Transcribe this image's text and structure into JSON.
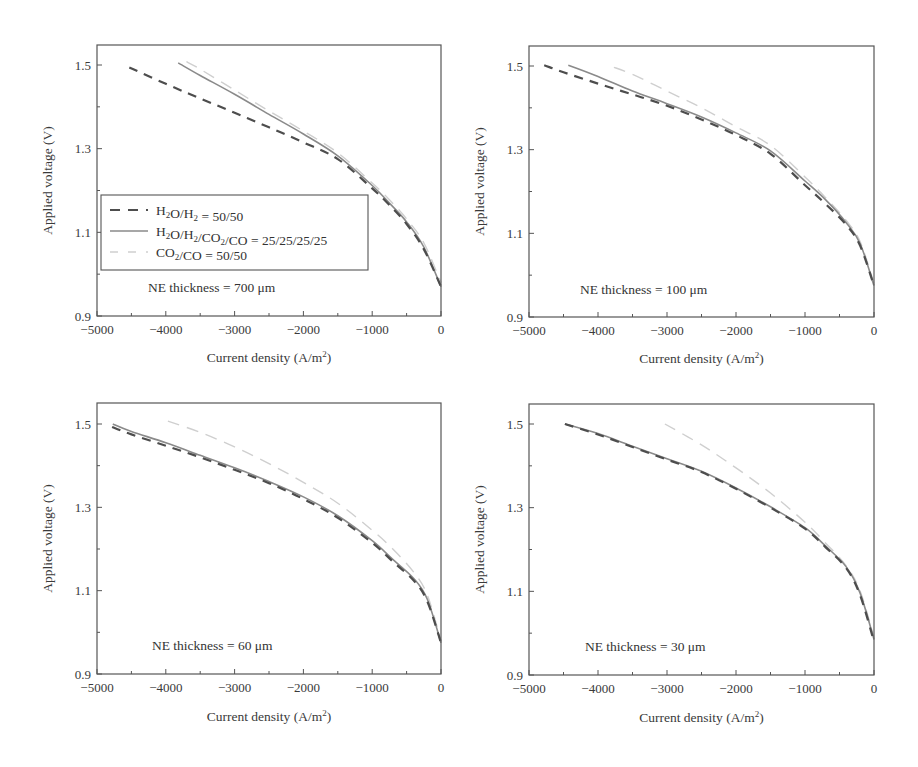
{
  "figure": {
    "legend": {
      "items": [
        {
          "label": "H2O/H2 = 50/50",
          "style": "dashed-dark"
        },
        {
          "label": "H2O/H2/CO2/CO = 25/25/25/25",
          "style": "solid-gray"
        },
        {
          "label": "CO2/CO = 50/50",
          "style": "dashed-light"
        }
      ]
    },
    "series_styles": {
      "H2O/H2 = 50/50": {
        "color": "#4d4d4d",
        "width": 2.2,
        "dash": "9,7"
      },
      "H2O/H2/CO2/CO = 25/25/25/25": {
        "color": "#8a8a8a",
        "width": 1.6,
        "dash": ""
      },
      "CO2/CO = 50/50": {
        "color": "#cfcfcf",
        "width": 1.4,
        "dash": "12,8"
      }
    }
  },
  "chart_data": [
    {
      "type": "line",
      "panel": "top-left",
      "title": "",
      "annotation": "NE thickness = 700 μm",
      "xlabel": "Current density (A/m²)",
      "ylabel": "Applied voltage (V)",
      "xlim": [
        -5000,
        0
      ],
      "ylim": [
        0.9,
        1.55
      ],
      "xticks": [
        -5000,
        -4000,
        -3000,
        -2000,
        -1000,
        0
      ],
      "yticks": [
        0.9,
        1.1,
        1.3,
        1.5
      ],
      "grid": false,
      "legend_position": "center-left (inside)",
      "series": [
        {
          "name": "H2O/H2 = 50/50",
          "x": [
            -4530,
            -4000,
            -3500,
            -3000,
            -2500,
            -2000,
            -1500,
            -1000,
            -750,
            -500,
            -250,
            0
          ],
          "values": [
            1.494,
            1.455,
            1.42,
            1.386,
            1.351,
            1.315,
            1.275,
            1.205,
            1.165,
            1.12,
            1.06,
            0.97
          ]
        },
        {
          "name": "H2O/H2/CO2/CO = 25/25/25/25",
          "x": [
            -3820,
            -3500,
            -3000,
            -2500,
            -2000,
            -1500,
            -1000,
            -750,
            -500,
            -250,
            0
          ],
          "values": [
            1.505,
            1.475,
            1.43,
            1.382,
            1.335,
            1.283,
            1.212,
            1.17,
            1.125,
            1.065,
            0.97
          ]
        },
        {
          "name": "CO2/CO = 50/50",
          "x": [
            -3700,
            -3500,
            -3000,
            -2500,
            -2000,
            -1500,
            -1000,
            -750,
            -500,
            -250,
            0
          ],
          "values": [
            1.508,
            1.49,
            1.44,
            1.39,
            1.342,
            1.29,
            1.218,
            1.178,
            1.132,
            1.075,
            0.98
          ]
        }
      ]
    },
    {
      "type": "line",
      "panel": "top-right",
      "title": "",
      "annotation": "NE thickness = 100 μm",
      "xlabel": "Current density (A/m²)",
      "ylabel": "Applied voltage (V)",
      "xlim": [
        -5000,
        0
      ],
      "ylim": [
        0.9,
        1.55
      ],
      "xticks": [
        -5000,
        -4000,
        -3000,
        -2000,
        -1000,
        0
      ],
      "yticks": [
        0.9,
        1.1,
        1.3,
        1.5
      ],
      "grid": false,
      "series": [
        {
          "name": "H2O/H2 = 50/50",
          "x": [
            -4780,
            -4500,
            -4000,
            -3500,
            -3000,
            -2500,
            -2000,
            -1500,
            -1000,
            -700,
            -400,
            -200,
            0
          ],
          "values": [
            1.502,
            1.485,
            1.458,
            1.432,
            1.405,
            1.372,
            1.335,
            1.29,
            1.215,
            1.17,
            1.12,
            1.07,
            0.975
          ]
        },
        {
          "name": "H2O/H2/CO2/CO = 25/25/25/25",
          "x": [
            -4430,
            -4000,
            -3500,
            -3000,
            -2500,
            -2000,
            -1500,
            -1000,
            -700,
            -400,
            -200,
            0
          ],
          "values": [
            1.502,
            1.475,
            1.44,
            1.41,
            1.378,
            1.34,
            1.297,
            1.225,
            1.18,
            1.125,
            1.075,
            0.975
          ]
        },
        {
          "name": "CO2/CO = 50/50",
          "x": [
            -3770,
            -3500,
            -3000,
            -2500,
            -2000,
            -1500,
            -1000,
            -700,
            -400,
            -200,
            0
          ],
          "values": [
            1.497,
            1.48,
            1.44,
            1.4,
            1.355,
            1.31,
            1.235,
            1.185,
            1.13,
            1.08,
            0.98
          ]
        }
      ]
    },
    {
      "type": "line",
      "panel": "bottom-left",
      "title": "",
      "annotation": "NE thickness = 60 μm",
      "xlabel": "Current density (A/m²)",
      "ylabel": "Applied voltage (V)",
      "xlim": [
        -5000,
        0
      ],
      "ylim": [
        0.9,
        1.55
      ],
      "xticks": [
        -5000,
        -4000,
        -3000,
        -2000,
        -1000,
        0
      ],
      "yticks": [
        0.9,
        1.1,
        1.3,
        1.5
      ],
      "grid": false,
      "series": [
        {
          "name": "H2O/H2 = 50/50",
          "x": [
            -4780,
            -4500,
            -4000,
            -3500,
            -3000,
            -2500,
            -2000,
            -1500,
            -1000,
            -700,
            -400,
            -200,
            0
          ],
          "values": [
            1.493,
            1.475,
            1.448,
            1.42,
            1.39,
            1.358,
            1.32,
            1.275,
            1.215,
            1.17,
            1.125,
            1.075,
            0.975
          ]
        },
        {
          "name": "H2O/H2/CO2/CO = 25/25/25/25",
          "x": [
            -4770,
            -4500,
            -4000,
            -3500,
            -3000,
            -2500,
            -2000,
            -1500,
            -1000,
            -700,
            -400,
            -200,
            0
          ],
          "values": [
            1.5,
            1.482,
            1.455,
            1.425,
            1.395,
            1.362,
            1.325,
            1.28,
            1.22,
            1.175,
            1.13,
            1.08,
            0.975
          ]
        },
        {
          "name": "CO2/CO = 50/50",
          "x": [
            -3970,
            -3500,
            -3000,
            -2500,
            -2000,
            -1500,
            -1000,
            -700,
            -400,
            -200,
            0
          ],
          "values": [
            1.507,
            1.48,
            1.445,
            1.405,
            1.36,
            1.31,
            1.245,
            1.2,
            1.145,
            1.09,
            0.98
          ]
        }
      ]
    },
    {
      "type": "line",
      "panel": "bottom-right",
      "title": "",
      "annotation": "NE thickness = 30 μm",
      "xlabel": "Current density (A/m²)",
      "ylabel": "Applied voltage (V)",
      "xlim": [
        -5000,
        0
      ],
      "ylim": [
        0.9,
        1.55
      ],
      "xticks": [
        -5000,
        -4000,
        -3000,
        -2000,
        -1000,
        0
      ],
      "yticks": [
        0.9,
        1.1,
        1.3,
        1.5
      ],
      "grid": false,
      "series": [
        {
          "name": "H2O/H2 = 50/50",
          "x": [
            -4480,
            -4000,
            -3500,
            -3000,
            -2500,
            -2000,
            -1500,
            -1000,
            -700,
            -400,
            -200,
            0
          ],
          "values": [
            1.5,
            1.475,
            1.445,
            1.415,
            1.385,
            1.345,
            1.3,
            1.25,
            1.205,
            1.155,
            1.09,
            0.98
          ]
        },
        {
          "name": "H2O/H2/CO2/CO = 25/25/25/25",
          "x": [
            -4480,
            -4000,
            -3500,
            -3000,
            -2500,
            -2000,
            -1500,
            -1000,
            -700,
            -400,
            -200,
            0
          ],
          "values": [
            1.5,
            1.477,
            1.447,
            1.417,
            1.387,
            1.347,
            1.302,
            1.252,
            1.208,
            1.158,
            1.095,
            0.985
          ]
        },
        {
          "name": "CO2/CO = 50/50",
          "x": [
            -3030,
            -2500,
            -2000,
            -1500,
            -1000,
            -700,
            -400,
            -200,
            0
          ],
          "values": [
            1.5,
            1.45,
            1.395,
            1.335,
            1.265,
            1.215,
            1.16,
            1.1,
            0.99
          ]
        }
      ]
    }
  ]
}
